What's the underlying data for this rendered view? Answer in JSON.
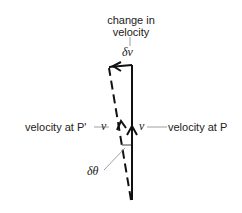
{
  "diagram": {
    "title_label": {
      "line1": "change in",
      "line2": "velocity"
    },
    "delta_v_symbol": "δv",
    "left_label": "velocity at P'",
    "left_symbol": "v",
    "right_symbol": "v",
    "right_label": "velocity at P",
    "angle_symbol": "δθ",
    "colors": {
      "stroke": "#111111",
      "leader": "#888888",
      "background": "#ffffff"
    }
  }
}
